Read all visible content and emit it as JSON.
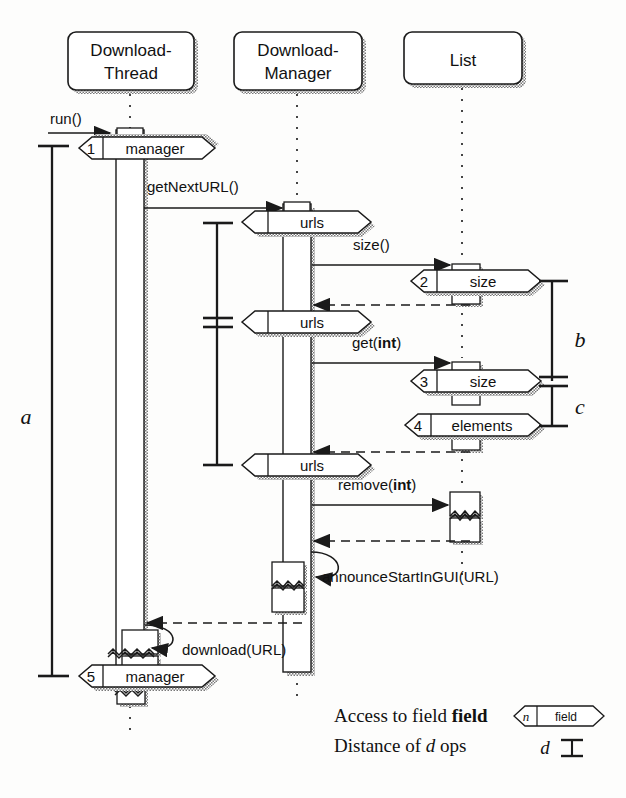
{
  "diagram": {
    "lifelines": [
      {
        "id": "thread",
        "name": "DownloadThread",
        "line1": "Download-",
        "line2": "Thread",
        "x": 130,
        "box_x": 68,
        "box_y": 32,
        "box_w": 126,
        "box_h": 58
      },
      {
        "id": "manager",
        "name": "DownloadManager",
        "line1": "Download-",
        "line2": "Manager",
        "x": 297,
        "box_x": 234,
        "box_y": 32,
        "box_w": 128,
        "box_h": 58
      },
      {
        "id": "list",
        "name": "List",
        "line1": "List",
        "line2": "",
        "x": 462,
        "box_x": 404,
        "box_y": 32,
        "box_w": 118,
        "box_h": 52
      }
    ],
    "messages": [
      {
        "id": "run",
        "label": "run()",
        "label_bold": "",
        "x1": 48,
        "x2": 112,
        "y": 125,
        "style": "solid",
        "from": "external",
        "to": "thread"
      },
      {
        "id": "getnexturl",
        "label": "getNextURL()",
        "label_bold": "",
        "x1": 144,
        "x2": 280,
        "y": 199,
        "style": "solid",
        "from": "thread",
        "to": "manager"
      },
      {
        "id": "size",
        "label": "size()",
        "label_bold": "",
        "x1": 310,
        "x2": 448,
        "y": 257,
        "style": "solid",
        "from": "manager",
        "to": "list"
      },
      {
        "id": "size_ret",
        "label": "",
        "label_bold": "",
        "x1": 470,
        "x2": 312,
        "y": 300,
        "style": "dashed",
        "from": "list",
        "to": "manager"
      },
      {
        "id": "get",
        "label": "get(",
        "label_bold": "int",
        "x1": 310,
        "x2": 448,
        "y": 354,
        "style": "solid",
        "from": "manager",
        "to": "list"
      },
      {
        "id": "get_ret",
        "label": "",
        "label_bold": "",
        "x1": 470,
        "x2": 312,
        "y": 448,
        "style": "dashed",
        "from": "list",
        "to": "manager"
      },
      {
        "id": "remove",
        "label": "remove(",
        "label_bold": "int",
        "x1": 310,
        "x2": 448,
        "y": 497,
        "style": "solid",
        "from": "manager",
        "to": "list"
      },
      {
        "id": "remove_ret",
        "label": "",
        "label_bold": "",
        "x1": 470,
        "x2": 312,
        "y": 537,
        "style": "dashed",
        "from": "list",
        "to": "manager"
      },
      {
        "id": "announce",
        "label": "announceStartInGUI(URL)",
        "label_bold": "",
        "x1": 0,
        "x2": 0,
        "y": 578,
        "style": "self",
        "from": "manager",
        "to": "manager"
      },
      {
        "id": "mgr_ret",
        "label": "",
        "label_bold": "",
        "x1": 300,
        "x2": 145,
        "y": 619,
        "style": "dashed",
        "from": "manager",
        "to": "thread"
      },
      {
        "id": "download",
        "label": "download(URL)",
        "label_bold": "",
        "x1": 0,
        "x2": 0,
        "y": 648,
        "style": "self",
        "from": "thread",
        "to": "thread"
      }
    ],
    "field_accesses": [
      {
        "id": "fa1",
        "num": "1",
        "field": "manager",
        "cx": 130,
        "cy": 148,
        "w": 122
      },
      {
        "id": "fa2",
        "num": "",
        "field": "urls",
        "cx": 297,
        "cy": 222,
        "w": 118
      },
      {
        "id": "fa3",
        "num": "2",
        "field": "size",
        "cx": 470,
        "cy": 281,
        "w": 118
      },
      {
        "id": "fa4",
        "num": "",
        "field": "urls",
        "cx": 297,
        "cy": 322,
        "w": 118
      },
      {
        "id": "fa5",
        "num": "3",
        "field": "size",
        "cx": 470,
        "cy": 381,
        "w": 118
      },
      {
        "id": "fa6",
        "num": "4",
        "field": "elements",
        "cx": 470,
        "cy": 425,
        "w": 126
      },
      {
        "id": "fa7",
        "num": "",
        "field": "urls",
        "cx": 297,
        "cy": 465,
        "w": 118
      },
      {
        "id": "fa8",
        "num": "5",
        "field": "manager",
        "cx": 130,
        "cy": 676,
        "w": 122
      }
    ],
    "distance_markers": [
      {
        "id": "dist_a",
        "label": "a",
        "x": 52,
        "y1": 146,
        "y2": 676,
        "label_x": 32,
        "label_y": 418,
        "mid": null
      },
      {
        "id": "dist_mgr",
        "label": "",
        "x": 217,
        "y1": 223,
        "y2": 465,
        "label_x": 0,
        "label_y": 0,
        "mid": 322
      },
      {
        "id": "dist_b",
        "label": "b",
        "x": 552,
        "y1": 281,
        "y2": 381,
        "label_x": 573,
        "label_y": 340,
        "mid": null
      },
      {
        "id": "dist_c",
        "label": "c",
        "x": 552,
        "y1": 383,
        "y2": 426,
        "label_x": 573,
        "label_y": 411,
        "mid": null
      }
    ],
    "legend": [
      {
        "id": "legend-field",
        "pre": "Access to field ",
        "em": "field",
        "post": "",
        "sample": "hexagon",
        "sample_num": "n",
        "sample_text": "field"
      },
      {
        "id": "legend-distance",
        "pre": "Distance of ",
        "em": "d",
        "post": " ops",
        "sample": "ibeam",
        "sample_num": "d",
        "sample_text": ""
      }
    ],
    "colors": {
      "stroke": "#1a1a1a",
      "shadow": "#9a9a9a",
      "fill": "#ffffff",
      "page": "#fdfdfc"
    }
  }
}
